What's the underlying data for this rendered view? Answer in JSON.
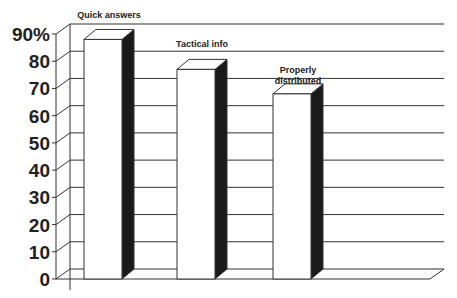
{
  "chart_data": {
    "type": "bar",
    "style": "3d-column",
    "title": "",
    "xlabel": "",
    "ylabel": "",
    "categories": [
      "Quick answers",
      "Tactical info",
      "Properly distributed"
    ],
    "category_label_lines": [
      [
        "Quick answers"
      ],
      [
        "Tactical info"
      ],
      [
        "Properly",
        "distributed"
      ]
    ],
    "values": [
      88,
      77,
      68
    ],
    "ylim": [
      0,
      90
    ],
    "yticks": [
      0,
      10,
      20,
      30,
      40,
      50,
      60,
      70,
      80,
      90
    ],
    "ytick_labels": [
      "0",
      "10",
      "20",
      "30",
      "40",
      "50",
      "60",
      "70",
      "80",
      "90%"
    ],
    "grid": true,
    "legend": "none",
    "colors": {
      "bar_front": "#ffffff",
      "bar_side": "#1a1a1a",
      "bar_top": "#ffffff",
      "lines": "#333333"
    }
  }
}
